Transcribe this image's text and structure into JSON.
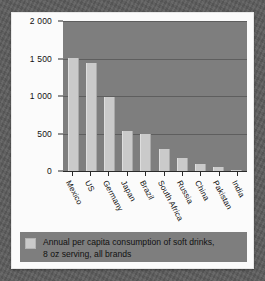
{
  "chart_data": {
    "type": "bar",
    "title": "",
    "subtitle": "",
    "xlabel": "",
    "ylabel": "",
    "categories": [
      "Mexico",
      "US",
      "Germany",
      "Japan",
      "Brazil",
      "South Africa",
      "Russia",
      "China",
      "Pakistan",
      "India"
    ],
    "values": [
      1510,
      1440,
      990,
      540,
      500,
      300,
      180,
      95,
      50,
      20
    ],
    "series": [
      {
        "name": "Annual per capita consumption of soft drinks, 8 oz serving, all brands",
        "values": [
          1510,
          1440,
          990,
          540,
          500,
          300,
          180,
          95,
          50,
          20
        ]
      }
    ],
    "ylim": [
      0,
      2000
    ],
    "yticks": [
      0,
      500,
      1000,
      1500,
      2000
    ],
    "ytick_labels": [
      "0",
      "500",
      "1 000",
      "1 500",
      "2 000"
    ],
    "grid": true,
    "grid_axis": "y",
    "legend_position": "bottom",
    "bar_color": "#cacaca",
    "plot_background": "#7e7e7e",
    "gridline_color": "#5e5e5e",
    "axis_color": "#2a2a2a",
    "page_background": "#5d5d5d",
    "card_background": "#fbfbfb"
  },
  "axis": {
    "y_ticks": [
      {
        "label": "2 000",
        "value": 2000
      },
      {
        "label": "1 500",
        "value": 1500
      },
      {
        "label": "1 000",
        "value": 1000
      },
      {
        "label": "500",
        "value": 500
      },
      {
        "label": "0",
        "value": 0
      }
    ],
    "x_labels": [
      "Mexico",
      "US",
      "Germany",
      "Japan",
      "Brazil",
      "South Africa",
      "Russia",
      "China",
      "Pakistan",
      "India"
    ]
  },
  "legend": {
    "swatch_color": "#cacaca",
    "line1": "Annual per capita consumption of soft drinks,",
    "line2": "8 oz serving, all brands"
  }
}
